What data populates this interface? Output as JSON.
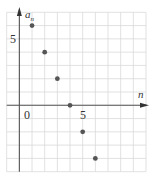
{
  "chart_data": {
    "type": "scatter",
    "title": "",
    "xlabel": "n",
    "ylabel": "a_n",
    "ylabel_main": "a",
    "ylabel_sub": "n",
    "x": [
      1,
      2,
      3,
      4,
      5,
      6
    ],
    "y": [
      6,
      4,
      2,
      0,
      -2,
      -4
    ],
    "series": [
      {
        "name": "a_n",
        "x": [
          1,
          2,
          3,
          4,
          5,
          6
        ],
        "values": [
          6,
          4,
          2,
          0,
          -2,
          -4
        ]
      }
    ],
    "xlim": [
      -1,
      10
    ],
    "ylim": [
      -5,
      7
    ],
    "x_tick_labels": [
      {
        "value": 0,
        "label": "0"
      },
      {
        "value": 5,
        "label": "5"
      }
    ],
    "y_tick_labels": [
      {
        "value": 5,
        "label": "5"
      }
    ],
    "grid": true,
    "legend": "none",
    "colors": {
      "grid": "#d9d9d9",
      "axis": "#555555",
      "point": "#555555"
    }
  }
}
